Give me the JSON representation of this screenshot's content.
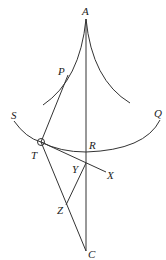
{
  "diagram": {
    "type": "geometric-construction",
    "labels": {
      "A": "A",
      "P": "P",
      "S": "S",
      "Q": "Q",
      "T": "T",
      "R": "R",
      "Y": "Y",
      "X": "X",
      "Z": "Z",
      "C": "C"
    },
    "colors": {
      "stroke": "#333333",
      "text": "#222222",
      "background": "#ffffff"
    }
  }
}
